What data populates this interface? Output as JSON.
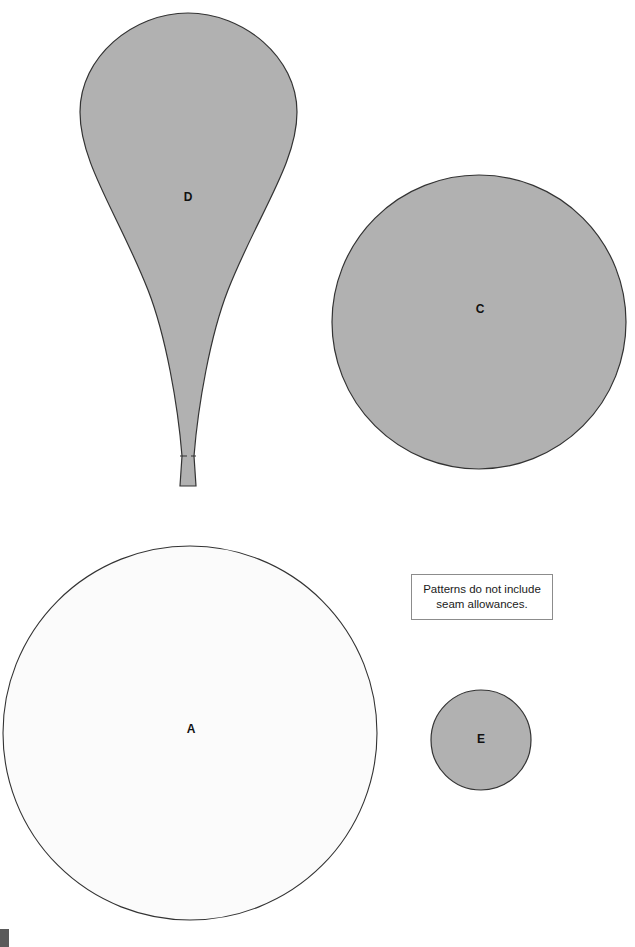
{
  "page": {
    "background_color": "#ffffff",
    "width": 635,
    "height": 947
  },
  "note": {
    "line1": "Patterns do not include",
    "line2": "seam allowances.",
    "border_color": "#8c8c8c",
    "background_color": "#ffffff"
  },
  "colors": {
    "shaded_fill": "#b1b1b1",
    "light_fill": "#fbfbfb",
    "outline": "#333333",
    "label_text": "#111111",
    "corner_mark": "#5a5a5a"
  },
  "pieces": [
    {
      "label": "D",
      "shape": "teardrop",
      "fill": "#b1b1b1",
      "label_x": 188,
      "label_y": 198,
      "has_fold_line": true
    },
    {
      "label": "C",
      "shape": "circle",
      "fill": "#b1b1b1",
      "cx": 479,
      "cy": 322,
      "r": 147,
      "label_x": 480,
      "label_y": 310
    },
    {
      "label": "A",
      "shape": "circle",
      "fill": "#fbfbfb",
      "cx": 190,
      "cy": 733,
      "r": 187,
      "label_x": 191,
      "label_y": 730
    },
    {
      "label": "E",
      "shape": "circle",
      "fill": "#b1b1b1",
      "cx": 481,
      "cy": 740,
      "r": 50,
      "label_x": 481,
      "label_y": 740
    }
  ]
}
